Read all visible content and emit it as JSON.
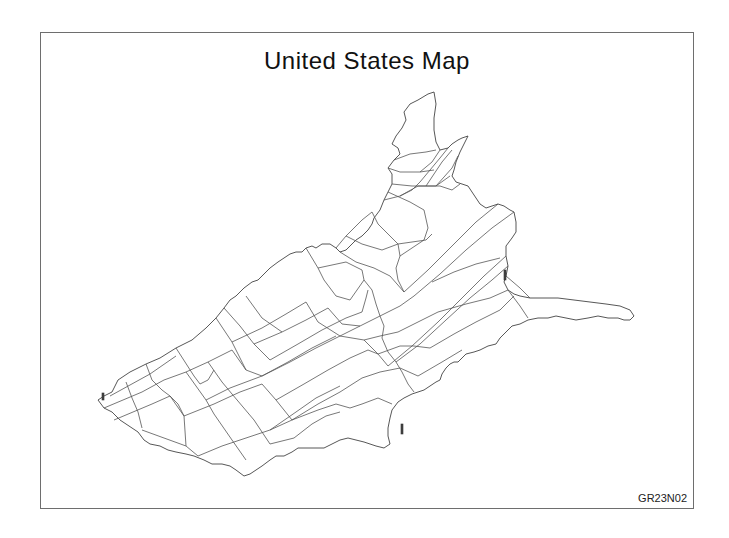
{
  "title": "United States Map",
  "footnote": "GR23N02",
  "colors": {
    "background": "#ffffff",
    "frame": "#6e6e6e",
    "outline": "#555555",
    "text": "#111111"
  },
  "map": {
    "projection": "rotated/oblique view (west at lower-left, northeast at top)",
    "regions": "contiguous US state boundaries, unfilled outlines"
  }
}
